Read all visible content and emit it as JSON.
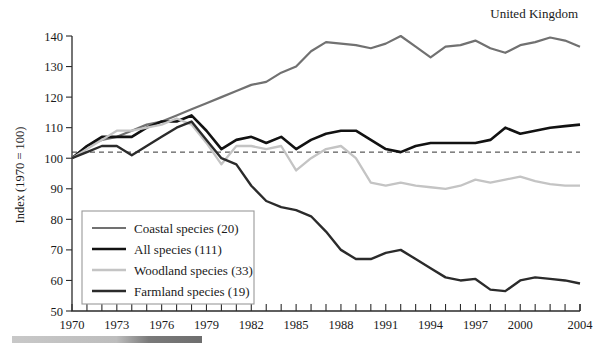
{
  "region_label": "United Kingdom",
  "chart_data": {
    "type": "line",
    "title": "",
    "subtitle": "",
    "xlabel": "",
    "ylabel": "Index (1970 = 100)",
    "xlim": [
      1970,
      2004
    ],
    "ylim": [
      50,
      140
    ],
    "ytick_step": 10,
    "xtick_step": 1,
    "xtick_label_step": 3,
    "grid": false,
    "legend_position": "lower-left",
    "reference_line": {
      "name": "baseline-102",
      "value": 102,
      "style": "dashed",
      "color": "#333333"
    },
    "yticks": [
      50,
      60,
      70,
      80,
      90,
      100,
      110,
      120,
      130,
      140
    ],
    "ytick_labels": [
      "50",
      "60",
      "70",
      "80",
      "90",
      "100",
      "110",
      "120",
      "130",
      "140"
    ],
    "xticks": [
      1970,
      1971,
      1972,
      1973,
      1974,
      1975,
      1976,
      1977,
      1978,
      1979,
      1980,
      1981,
      1982,
      1983,
      1984,
      1985,
      1986,
      1987,
      1988,
      1989,
      1990,
      1991,
      1992,
      1993,
      1994,
      1995,
      1996,
      1997,
      1998,
      1999,
      2000,
      2001,
      2002,
      2003,
      2004
    ],
    "xtick_labels": [
      "1970",
      "1973",
      "1976",
      "1979",
      "1982",
      "1985",
      "1988",
      "1991",
      "1994",
      "1997",
      "2000",
      "2004"
    ],
    "x": [
      1970,
      1971,
      1972,
      1973,
      1974,
      1975,
      1976,
      1977,
      1978,
      1979,
      1980,
      1981,
      1982,
      1983,
      1984,
      1985,
      1986,
      1987,
      1988,
      1989,
      1990,
      1991,
      1992,
      1993,
      1994,
      1995,
      1996,
      1997,
      1998,
      1999,
      2000,
      2001,
      2002,
      2003,
      2004
    ],
    "series": [
      {
        "name": "Coastal species (20)",
        "short_name": "coastal",
        "color": "#717171",
        "width": 2.2,
        "values": [
          100,
          104,
          106,
          107,
          109,
          111,
          112,
          114,
          116,
          118,
          120,
          122,
          124,
          125,
          128,
          130,
          135,
          138,
          137.5,
          137,
          136,
          137.5,
          140,
          136.5,
          133,
          136.5,
          137,
          138.5,
          136,
          134.5,
          137,
          138,
          139.5,
          138.5,
          136.5
        ]
      },
      {
        "name": "All species (111)",
        "short_name": "all",
        "color": "#121212",
        "width": 2.6,
        "values": [
          100,
          104,
          107,
          107,
          107,
          110,
          112,
          112,
          114,
          109,
          103,
          106,
          107,
          105,
          107,
          103,
          106,
          108,
          109,
          109,
          106,
          103,
          102,
          104,
          105,
          105,
          105,
          105,
          106,
          110,
          108,
          109,
          110,
          110.5,
          111
        ]
      },
      {
        "name": "Woodland species (33)",
        "short_name": "woodland",
        "color": "#c4c4c4",
        "width": 2.3,
        "values": [
          100,
          103,
          106,
          109,
          109,
          110,
          111,
          113,
          111,
          105,
          98,
          104,
          104,
          103,
          104,
          96,
          100,
          103,
          104,
          100,
          92,
          91,
          92,
          91,
          90.5,
          90,
          91,
          93,
          92,
          93,
          94,
          92.5,
          91.5,
          91,
          91
        ]
      },
      {
        "name": "Farmland species (19)",
        "short_name": "farmland",
        "color": "#2b2b2b",
        "width": 2.4,
        "values": [
          100,
          102,
          104,
          104,
          101,
          104,
          107,
          110,
          112,
          106,
          100,
          98,
          91,
          86,
          84,
          83,
          81,
          76,
          70,
          67,
          67,
          69,
          70,
          67,
          64,
          61,
          60,
          60.5,
          57,
          56.5,
          60,
          61,
          60.5,
          60,
          59
        ]
      }
    ],
    "legend": [
      {
        "label": "Coastal species (20)",
        "color": "#717171",
        "width": 2.2
      },
      {
        "label": "All species (111)",
        "color": "#121212",
        "width": 2.6
      },
      {
        "label": "Woodland species (33)",
        "color": "#c4c4c4",
        "width": 2.3
      },
      {
        "label": "Farmland species (19)",
        "color": "#2b2b2b",
        "width": 2.4
      }
    ]
  }
}
